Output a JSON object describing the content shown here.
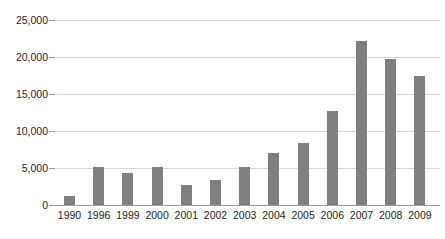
{
  "chart_data": {
    "type": "bar",
    "title": "",
    "subtitle": "",
    "xlabel": "",
    "ylabel": "",
    "categories": [
      "1990",
      "1996",
      "1999",
      "2000",
      "2001",
      "2002",
      "2003",
      "2004",
      "2005",
      "2006",
      "2007",
      "2008",
      "2009"
    ],
    "values": [
      1200,
      5100,
      4300,
      5200,
      2700,
      3400,
      5200,
      7000,
      8400,
      12700,
      22200,
      19700,
      17500
    ],
    "series": [
      {
        "name": "",
        "values": [
          1200,
          5100,
          4300,
          5200,
          2700,
          3400,
          5200,
          7000,
          8400,
          12700,
          22200,
          19700,
          17500
        ]
      }
    ],
    "ylim": [
      0,
      25000
    ],
    "ytick_values": [
      0,
      5000,
      10000,
      15000,
      20000,
      25000
    ],
    "ytick_labels": [
      "0",
      "5,000",
      "10,000",
      "15,000",
      "20,000",
      "25,000"
    ],
    "grid": true,
    "grid_axis": "y",
    "legend": false,
    "legend_position": "none",
    "annotations": [],
    "colors": {
      "bar": "#808080",
      "gridline": "#d6d6d6",
      "axis": "#9a9a9a",
      "text": "#231f20",
      "background": "#ffffff"
    }
  }
}
